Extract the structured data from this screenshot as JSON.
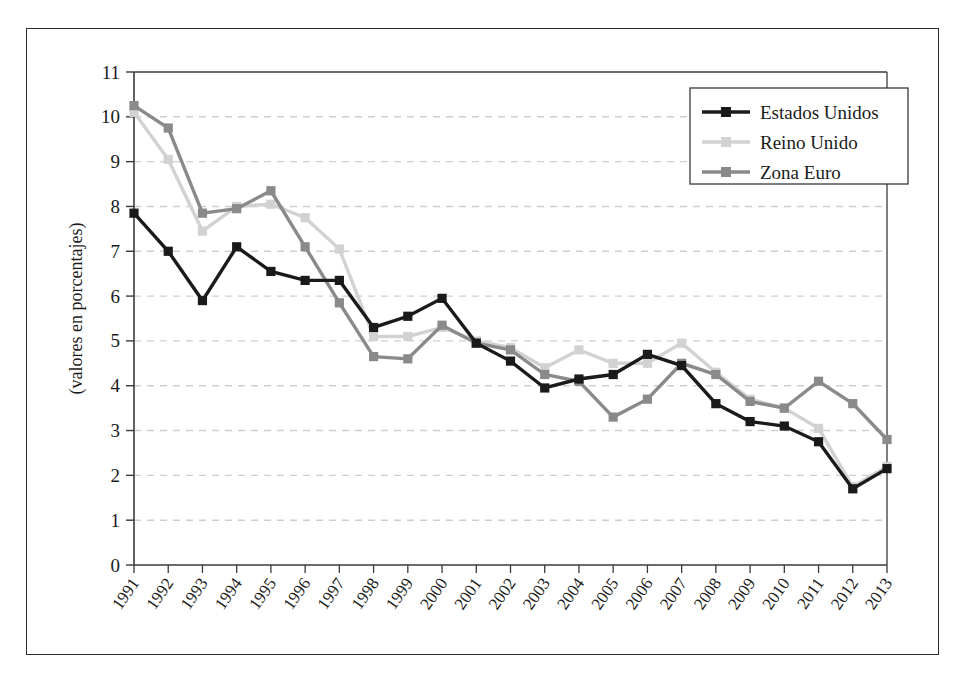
{
  "figure": {
    "frame_color": "#2b2b2b",
    "background": "#ffffff"
  },
  "chart_data": {
    "type": "line",
    "title": "",
    "xlabel": "",
    "ylabel": "(valores en porcentajes)",
    "ylim": [
      0,
      11
    ],
    "ytick_step": 1,
    "yticks": [
      "0",
      "1",
      "2",
      "3",
      "4",
      "5",
      "6",
      "7",
      "8",
      "9",
      "10",
      "11"
    ],
    "grid": "horizontal-dashed",
    "legend_position": "top-right",
    "categories": [
      "1991",
      "1992",
      "1993",
      "1994",
      "1995",
      "1996",
      "1997",
      "1998",
      "1999",
      "2000",
      "2001",
      "2002",
      "2003",
      "2004",
      "2005",
      "2006",
      "2007",
      "2008",
      "2009",
      "2010",
      "2011",
      "2012",
      "2013"
    ],
    "series": [
      {
        "name": "Estados Unidos",
        "color": "#1a1a1a",
        "marker": "square",
        "values": [
          7.85,
          7.0,
          5.9,
          7.1,
          6.55,
          6.35,
          6.35,
          5.3,
          5.55,
          5.95,
          4.95,
          4.55,
          3.95,
          4.15,
          4.25,
          4.7,
          4.45,
          3.6,
          3.2,
          3.1,
          2.75,
          1.7,
          2.15
        ]
      },
      {
        "name": "Reino Unido",
        "color": "#d2d2d2",
        "marker": "square",
        "values": [
          10.1,
          9.05,
          7.45,
          8.0,
          8.05,
          7.75,
          7.05,
          5.1,
          5.1,
          5.3,
          5.0,
          4.85,
          4.4,
          4.8,
          4.5,
          4.5,
          4.95,
          4.3,
          3.7,
          3.5,
          3.05,
          1.75,
          2.2
        ]
      },
      {
        "name": "Zona Euro",
        "color": "#8a8a8a",
        "marker": "square",
        "values": [
          10.25,
          9.75,
          7.85,
          7.95,
          8.35,
          7.1,
          5.85,
          4.65,
          4.6,
          5.35,
          4.95,
          4.8,
          4.25,
          4.1,
          3.3,
          3.7,
          4.5,
          4.25,
          3.65,
          3.5,
          4.1,
          3.6,
          2.8
        ]
      }
    ]
  }
}
